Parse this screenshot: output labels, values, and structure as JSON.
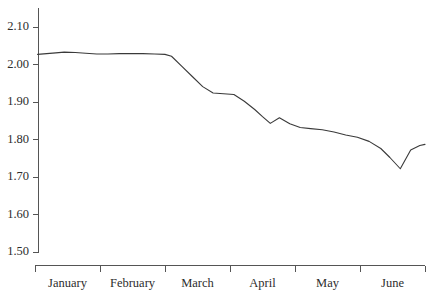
{
  "chart_data": {
    "type": "line",
    "title": "",
    "subtitle": "",
    "xlabel": "",
    "ylabel": "",
    "grid": false,
    "legend": false,
    "legend_position": "none",
    "axis": {
      "y_ticks": [
        "2.10",
        "2.00",
        "1.90",
        "1.80",
        "1.70",
        "1.60",
        "1.50"
      ],
      "y_tick_values": [
        2.1,
        2.0,
        1.9,
        1.8,
        1.7,
        1.6,
        1.5
      ],
      "ylim": [
        1.5,
        2.15
      ],
      "x_tick_labels": [
        "January",
        "February",
        "March",
        "April",
        "May",
        "June"
      ],
      "x_tick_boundaries": [
        0,
        1,
        2,
        3,
        4,
        5,
        6
      ],
      "xlim": [
        0,
        6.0
      ]
    },
    "line_color": "#3a3a3a",
    "axis_color": "#555555",
    "background_color": "#ffffff",
    "series": [
      {
        "name": "value",
        "x": [
          0.04,
          0.18,
          0.32,
          0.45,
          0.62,
          0.78,
          0.95,
          1.12,
          1.3,
          1.48,
          1.66,
          1.84,
          2.0,
          2.1,
          2.26,
          2.42,
          2.58,
          2.74,
          2.9,
          3.06,
          3.22,
          3.38,
          3.5,
          3.62,
          3.76,
          3.92,
          4.08,
          4.24,
          4.42,
          4.6,
          4.78,
          4.96,
          5.14,
          5.32,
          5.46,
          5.62,
          5.78,
          5.92,
          6.0
        ],
        "values": [
          2.027,
          2.029,
          2.031,
          2.033,
          2.032,
          2.03,
          2.028,
          2.028,
          2.029,
          2.029,
          2.029,
          2.028,
          2.027,
          2.022,
          1.995,
          1.968,
          1.941,
          1.924,
          1.922,
          1.92,
          1.902,
          1.88,
          1.861,
          1.843,
          1.858,
          1.842,
          1.832,
          1.829,
          1.826,
          1.82,
          1.812,
          1.806,
          1.795,
          1.776,
          1.752,
          1.722,
          1.772,
          1.784,
          1.787
        ]
      }
    ]
  }
}
